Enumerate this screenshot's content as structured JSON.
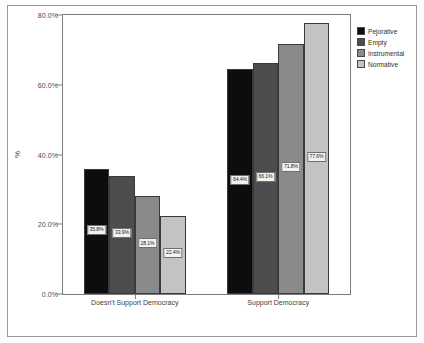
{
  "chart_data": {
    "type": "bar",
    "title": "",
    "xlabel": "",
    "ylabel": "%",
    "ylim": [
      0,
      80
    ],
    "grid": false,
    "legend_position": "top-right",
    "categories": [
      "Doesn't Support Democracy",
      "Support Democracy"
    ],
    "series": [
      {
        "name": "Pejorative",
        "color": "#0d0d0d",
        "values": [
          35.8,
          64.4
        ],
        "labels": [
          "35.8%",
          "64.4%"
        ]
      },
      {
        "name": "Empty",
        "color": "#4d4d4d",
        "values": [
          33.9,
          66.1
        ],
        "labels": [
          "33.9%",
          "66.1%"
        ]
      },
      {
        "name": "Instrumental",
        "color": "#8a8a8a",
        "values": [
          28.1,
          71.8
        ],
        "labels": [
          "28.1%",
          "71.8%"
        ]
      },
      {
        "name": "Normative",
        "color": "#c3c3c3",
        "values": [
          22.4,
          77.6
        ],
        "labels": [
          "22.4%",
          "77.6%"
        ]
      }
    ],
    "yticks": [
      {
        "value": 0,
        "label": "0.0%"
      },
      {
        "value": 20,
        "label": "20.0%"
      },
      {
        "value": 40,
        "label": "40.0%"
      },
      {
        "value": 60,
        "label": "60.0%"
      },
      {
        "value": 80,
        "label": "80.0%"
      }
    ]
  },
  "axis": {
    "y_title": "%"
  }
}
